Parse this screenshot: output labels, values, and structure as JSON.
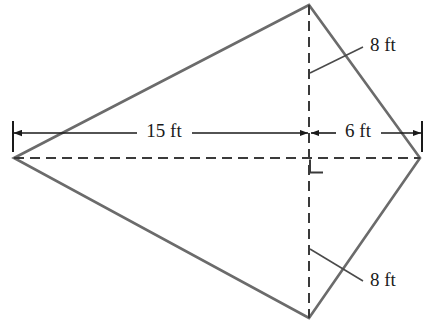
{
  "figure": {
    "kind": "geometry-diagram",
    "shape_name": "kite-quadrilateral",
    "units": "ft",
    "colors": {
      "outline": "#6b6b6b",
      "dashed": "#3a3a3a",
      "dimension": "#1a1a1a",
      "text": "#1a1a1a",
      "background": "#ffffff"
    },
    "vertices": {
      "left": {
        "x": 14,
        "y": 158
      },
      "top": {
        "x": 309,
        "y": 5
      },
      "right": {
        "x": 420,
        "y": 158
      },
      "bottom": {
        "x": 309,
        "y": 318
      }
    },
    "outline_path": "M 14 158 L 309 5 L 420 158 L 309 318 Z",
    "diagonals": {
      "horizontal": {
        "x1": 14,
        "y1": 158,
        "x2": 420,
        "y2": 158
      },
      "vertical": {
        "x1": 309,
        "y1": 5,
        "x2": 309,
        "y2": 318
      }
    },
    "right_angle_marker": {
      "x": 310,
      "y": 159,
      "size": 13
    },
    "dimension_line_y": 133,
    "extension_ticks": [
      {
        "x": 13,
        "y1": 122,
        "y2": 152
      },
      {
        "x": 422,
        "y1": 122,
        "y2": 152
      }
    ],
    "labels": {
      "left_span": "15 ft",
      "right_span": "6 ft",
      "upper_side": "8 ft",
      "lower_side": "8 ft"
    },
    "label_positions": {
      "left_span": {
        "x": 163,
        "y": 132
      },
      "right_span": {
        "x": 358,
        "y": 132
      },
      "upper_side": {
        "x": 392,
        "y": 48
      },
      "lower_side": {
        "x": 392,
        "y": 282
      }
    },
    "leader_lines": {
      "upper_side": {
        "x1": 310,
        "y1": 73,
        "x2": 362,
        "y2": 47
      },
      "lower_side": {
        "x1": 310,
        "y1": 249,
        "x2": 362,
        "y2": 281
      }
    }
  },
  "geometry_data": {
    "type": "polygon-diagram",
    "title": "",
    "description": "Kite-shaped quadrilateral with perpendicular diagonals",
    "measurements": [
      {
        "name": "left_span",
        "value": 15,
        "unit": "ft",
        "segment": "left vertex to diagonal intersection"
      },
      {
        "name": "right_span",
        "value": 6,
        "unit": "ft",
        "segment": "diagonal intersection to right vertex"
      },
      {
        "name": "upper_side",
        "value": 8,
        "unit": "ft",
        "segment": "top vertex to diagonal intersection"
      },
      {
        "name": "lower_side",
        "value": 8,
        "unit": "ft",
        "segment": "diagonal intersection to bottom vertex"
      }
    ],
    "right_angle": true
  }
}
